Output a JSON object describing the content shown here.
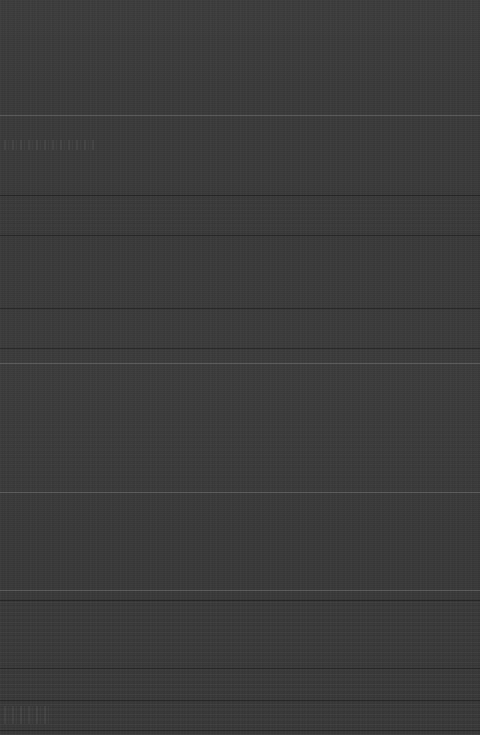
{
  "surface": {
    "width": 480,
    "height": 735,
    "background_color": "#3a3a3a",
    "description": "Uniform dark gray low-contrast surface with faint horizontal banding",
    "legible_text": "none"
  },
  "light_rules": [
    {
      "name": "divider-upper",
      "y": 115
    },
    {
      "name": "divider-mid",
      "y": 363
    },
    {
      "name": "divider-lower",
      "y": 492
    },
    {
      "name": "divider-bottom",
      "y": 590
    }
  ],
  "dark_rules": [
    {
      "name": "rule-1",
      "y": 195
    },
    {
      "name": "rule-2",
      "y": 235
    },
    {
      "name": "rule-3",
      "y": 308
    },
    {
      "name": "rule-4",
      "y": 348
    },
    {
      "name": "rule-5",
      "y": 600
    },
    {
      "name": "rule-6",
      "y": 668
    },
    {
      "name": "rule-7",
      "y": 700
    },
    {
      "name": "rule-8",
      "y": 730
    }
  ],
  "bands": [
    {
      "name": "band-upper",
      "y": 196,
      "height": 40,
      "opacity": 0.35
    },
    {
      "name": "band-middle",
      "y": 420,
      "height": 70,
      "opacity": 0.3
    },
    {
      "name": "band-lower",
      "y": 600,
      "height": 68,
      "opacity": 0.7
    },
    {
      "name": "band-foot",
      "y": 669,
      "height": 66,
      "opacity": 0.85
    }
  ],
  "smudges": [
    {
      "name": "smudge-upper-left",
      "x": 4,
      "y": 140,
      "width": 92,
      "height": 10
    },
    {
      "name": "smudge-foot-left",
      "x": 4,
      "y": 706,
      "width": 46,
      "height": 18
    }
  ]
}
